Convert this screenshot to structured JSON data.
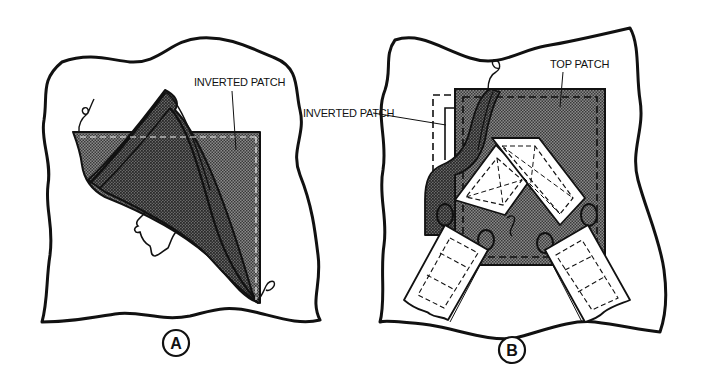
{
  "figure": {
    "panels": [
      {
        "id": "A",
        "caption": "A",
        "labels": [
          {
            "text": "INVERTED PATCH",
            "target": "inverted-patch"
          }
        ]
      },
      {
        "id": "B",
        "caption": "B",
        "labels": [
          {
            "text": "INVERTED PATCH",
            "target": "inverted-patch-outline"
          },
          {
            "text": "TOP PATCH",
            "target": "top-patch"
          }
        ]
      }
    ],
    "colors": {
      "ink": "#111111",
      "fabric_shade": "#6e6e6e",
      "fabric_shade_dark": "#555555",
      "paper": "#ffffff"
    }
  }
}
